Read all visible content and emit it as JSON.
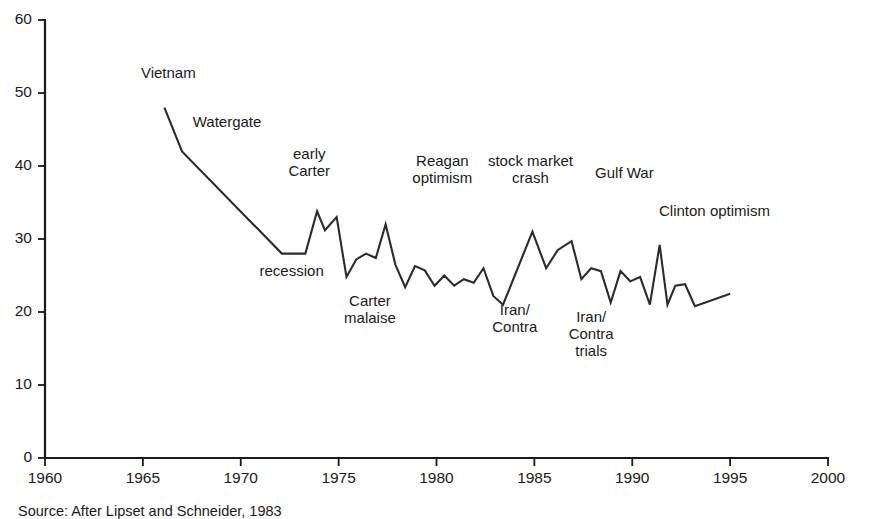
{
  "chart_data": {
    "type": "line",
    "title": "",
    "subtitle": "",
    "xlabel": "",
    "ylabel": "",
    "xlim": [
      1960,
      2000
    ],
    "ylim": [
      0,
      60
    ],
    "xticks": [
      1960,
      1965,
      1970,
      1975,
      1980,
      1985,
      1990,
      1995,
      2000
    ],
    "yticks": [
      0,
      10,
      20,
      30,
      40,
      50,
      60
    ],
    "grid": false,
    "legend": "none",
    "line_color": "#2b2b2b",
    "series": [
      {
        "name": "trust in government",
        "x": [
          1966.1,
          1967.0,
          1972.1,
          1973.3,
          1973.9,
          1974.3,
          1974.9,
          1975.4,
          1975.9,
          1976.4,
          1976.9,
          1977.4,
          1977.9,
          1978.4,
          1978.9,
          1979.4,
          1979.9,
          1980.4,
          1980.9,
          1981.4,
          1981.9,
          1982.4,
          1982.9,
          1983.4,
          1984.9,
          1985.6,
          1986.2,
          1986.9,
          1987.4,
          1987.9,
          1988.4,
          1988.9,
          1989.4,
          1989.9,
          1990.4,
          1990.9,
          1991.4,
          1991.8,
          1992.2,
          1992.7,
          1993.2,
          1995.0
        ],
        "y": [
          48.0,
          42.0,
          28.0,
          28.0,
          33.8,
          31.2,
          33.0,
          24.8,
          27.2,
          28.0,
          27.4,
          32.0,
          26.5,
          23.4,
          26.3,
          25.7,
          23.6,
          25.0,
          23.6,
          24.5,
          24.0,
          26.0,
          22.2,
          21.0,
          31.0,
          26.0,
          28.5,
          29.7,
          24.5,
          26.0,
          25.6,
          21.3,
          25.6,
          24.2,
          24.8,
          21.0,
          29.2,
          21.0,
          23.6,
          23.8,
          20.8,
          22.5
        ]
      }
    ],
    "annotations": [
      {
        "label": "Vietnam",
        "x": 1966.3,
        "y": 52.0,
        "lines": [
          "Vietnam"
        ]
      },
      {
        "label": "Watergate",
        "x": 1969.3,
        "y": 45.4,
        "lines": [
          "Watergate"
        ]
      },
      {
        "label": "early Carter",
        "x": 1973.5,
        "y": 41.0,
        "lines": [
          "early",
          "Carter"
        ]
      },
      {
        "label": "recession",
        "x": 1972.6,
        "y": 25.0,
        "lines": [
          "recession"
        ]
      },
      {
        "label": "Carter malaise",
        "x": 1976.6,
        "y": 20.8,
        "lines": [
          "Carter",
          "malaise"
        ]
      },
      {
        "label": "Reagan optimism",
        "x": 1980.3,
        "y": 40.0,
        "lines": [
          "Reagan",
          "optimism"
        ]
      },
      {
        "label": "Iran/Contra",
        "x": 1984.0,
        "y": 19.6,
        "lines": [
          "Iran/",
          "Contra"
        ]
      },
      {
        "label": "stock market crash",
        "x": 1984.8,
        "y": 40.0,
        "lines": [
          "stock market",
          "crash"
        ]
      },
      {
        "label": "Iran/Contra trials",
        "x": 1987.9,
        "y": 18.6,
        "lines": [
          "Iran/",
          "Contra",
          "trials"
        ]
      },
      {
        "label": "Gulf War",
        "x": 1989.6,
        "y": 38.3,
        "lines": [
          "Gulf War"
        ]
      },
      {
        "label": "Clinton optimism",
        "x": 1994.2,
        "y": 33.2,
        "lines": [
          "Clinton optimism"
        ]
      }
    ],
    "source_note": "Source: After Lipset and Schneider, 1983"
  }
}
